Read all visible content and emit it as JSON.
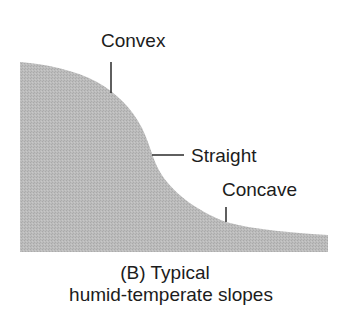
{
  "diagram": {
    "fill_color": "#b9b9b9",
    "line_color": "#2a2a2a",
    "labels": {
      "convex": "Convex",
      "straight": "Straight",
      "concave": "Concave"
    },
    "caption": {
      "line1": "(B)  Typical",
      "line2": "humid-temperate slopes"
    }
  }
}
